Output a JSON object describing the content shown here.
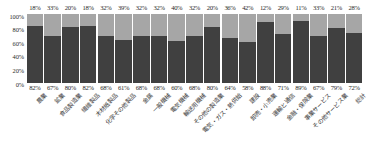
{
  "chart_data": {
    "type": "bar",
    "subtype": "stacked-100-percent",
    "title": "",
    "xlabel": "",
    "ylabel": "",
    "ylim": [
      0,
      100
    ],
    "grid": false,
    "legend_position": "none",
    "categories": [
      "農業",
      "鉱業",
      "食品製造業",
      "繊維製品",
      "木材紙製品",
      "化学その他製品",
      "金属",
      "一般機械",
      "電気機械",
      "輸送用機械",
      "その他の製造業",
      "電気・ガス・熱供給",
      "建設",
      "卸売・小売業",
      "運輸と通信",
      "金融・保険業",
      "事業サービス",
      "その他サービス業",
      "総計"
    ],
    "series": [
      {
        "name": "bottom",
        "color": "#404040",
        "values": [
          82,
          67,
          80,
          82,
          68,
          61,
          68,
          68,
          60,
          68,
          80,
          64,
          58,
          88,
          71,
          89,
          67,
          79,
          72
        ],
        "labels": [
          "82%",
          "67%",
          "80%",
          "82%",
          "68%",
          "61%",
          "68%",
          "68%",
          "60%",
          "68%",
          "80%",
          "64%",
          "58%",
          "88%",
          "71%",
          "89%",
          "67%",
          "79%",
          "72%"
        ]
      },
      {
        "name": "top",
        "color": "#a6a6a6",
        "values": [
          18,
          33,
          20,
          18,
          32,
          39,
          32,
          32,
          40,
          32,
          20,
          36,
          42,
          12,
          29,
          11,
          33,
          21,
          28
        ],
        "labels": [
          "18%",
          "33%",
          "20%",
          "18%",
          "32%",
          "39%",
          "32%",
          "32%",
          "40%",
          "32%",
          "20%",
          "36%",
          "42%",
          "12%",
          "29%",
          "11%",
          "33%",
          "21%",
          "28%"
        ]
      }
    ],
    "yticks": [
      "100%",
      "80%",
      "60%",
      "40%",
      "20%",
      "0%"
    ],
    "ytick_values": [
      100,
      80,
      60,
      40,
      20,
      0
    ]
  }
}
